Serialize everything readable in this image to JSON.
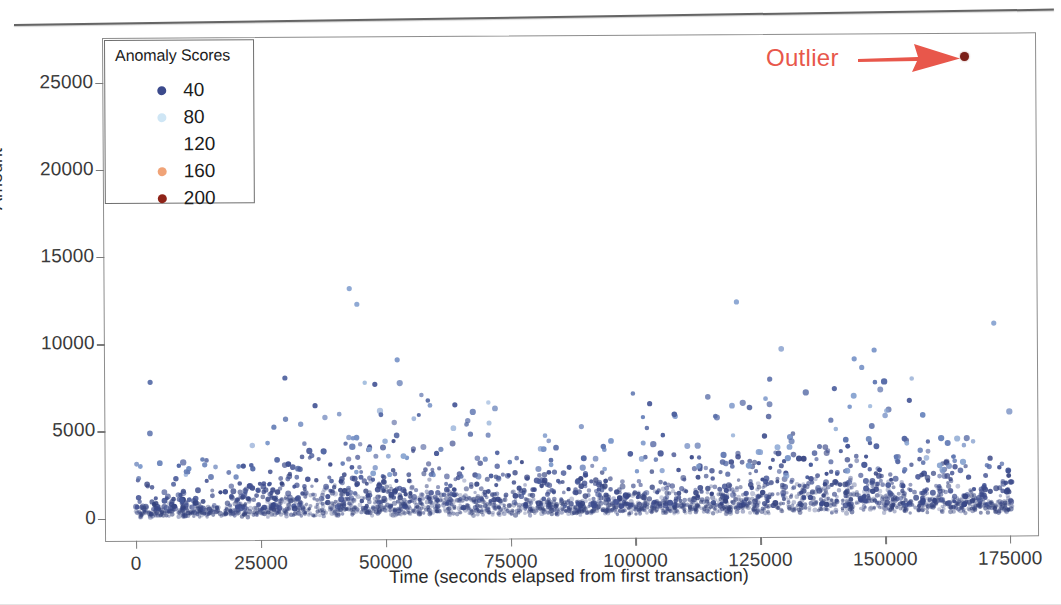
{
  "figure": {
    "background": "#ffffff",
    "frame_color": "#8d8d8d"
  },
  "annotation": {
    "outlier_label": "Outlier",
    "arrow_icon": "arrow-right-icon",
    "color": "#e8574b",
    "outlier_point_color": "#7a1f18"
  },
  "legend": {
    "title": "Anomaly Scores",
    "position": "upper-left-inside",
    "entries": [
      {
        "label": "40",
        "color": "#3b4a8c",
        "visible": true
      },
      {
        "label": "80",
        "color": "#cfe6f5",
        "visible": true
      },
      {
        "label": "120",
        "color": "#ffffff",
        "visible": false
      },
      {
        "label": "160",
        "color": "#f0a377",
        "visible": true
      },
      {
        "label": "200",
        "color": "#8e2318",
        "visible": true
      }
    ]
  },
  "chart_data": {
    "type": "scatter",
    "title": "",
    "xlabel": "Time (seconds elapsed from first transaction)",
    "ylabel": "Amount",
    "xlim": [
      -6000,
      181000
    ],
    "ylim": [
      -1400,
      27500
    ],
    "grid": false,
    "legend_title": "Anomaly Scores",
    "legend_position": "upper left",
    "colormap": "coolwarm",
    "color_scale": {
      "variable": "Anomaly Score",
      "ticks": [
        40,
        80,
        120,
        160,
        200
      ],
      "colors": [
        "#3b4a8c",
        "#cfe6f5",
        "#ffffff",
        "#f0a377",
        "#8e2318"
      ]
    },
    "xticks": [
      0,
      25000,
      50000,
      75000,
      100000,
      125000,
      150000,
      175000
    ],
    "xticklabels": [
      "0",
      "25000",
      "50000",
      "75000",
      "100000",
      "125000",
      "150000",
      "175000"
    ],
    "yticks": [
      0,
      5000,
      10000,
      15000,
      20000,
      25000
    ],
    "yticklabels": [
      "0",
      "5000",
      "10000",
      "15000",
      "20000",
      "25000"
    ],
    "annotations": [
      {
        "text": "Outlier",
        "x": 168000,
        "y": 26200,
        "arrow": true,
        "color": "#e8574b"
      }
    ],
    "notable_points": [
      {
        "x": 168000,
        "y": 26200,
        "score": 200,
        "label": "Outlier"
      },
      {
        "x": 43000,
        "y": 13100,
        "score": 85
      },
      {
        "x": 44500,
        "y": 12200,
        "score": 85
      },
      {
        "x": 120500,
        "y": 12200,
        "score": 85
      },
      {
        "x": 172000,
        "y": 10900,
        "score": 85
      },
      {
        "x": 148000,
        "y": 9400,
        "score": 80
      },
      {
        "x": 52500,
        "y": 9000,
        "score": 80
      },
      {
        "x": 144000,
        "y": 8900,
        "score": 80
      },
      {
        "x": 145500,
        "y": 8400,
        "score": 80
      },
      {
        "x": 3000,
        "y": 7800,
        "score": 60
      },
      {
        "x": 30000,
        "y": 8000,
        "score": 55
      },
      {
        "x": 48000,
        "y": 7600,
        "score": 50
      },
      {
        "x": 140000,
        "y": 7200,
        "score": 55
      },
      {
        "x": 103000,
        "y": 6400,
        "score": 50
      },
      {
        "x": 64000,
        "y": 6400,
        "score": 50
      },
      {
        "x": 36000,
        "y": 6400,
        "score": 50
      },
      {
        "x": 155000,
        "y": 6500,
        "score": 50
      }
    ],
    "density_description": "Dense navy-blue band of low anomaly-score transactions hugging Amount 0-2500 across the full time range, thinning upward; sparse lighter-blue points above 6000.",
    "n_points_approx": 2800
  }
}
